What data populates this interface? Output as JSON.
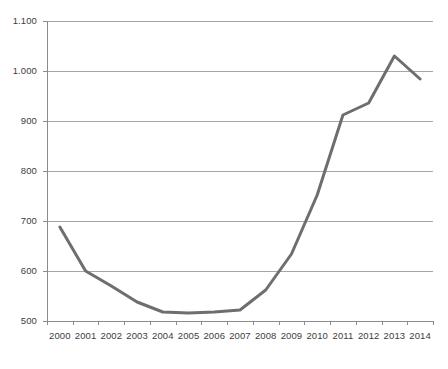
{
  "chart_data": {
    "type": "line",
    "title": "",
    "subtitle": "",
    "xlabel": "",
    "ylabel": "",
    "categories": [
      "2000",
      "2001",
      "2002",
      "2003",
      "2004",
      "2005",
      "2006",
      "2007",
      "2008",
      "2009",
      "2010",
      "2011",
      "2012",
      "2013",
      "2014"
    ],
    "series": [
      {
        "name": "",
        "values": [
          688,
          600,
          570,
          538,
          518,
          516,
          518,
          522,
          562,
          634,
          752,
          912,
          936,
          1030,
          984
        ]
      }
    ],
    "ylim": [
      500,
      1100
    ],
    "ytick_values": [
      500,
      600,
      700,
      800,
      900,
      1000,
      1100
    ],
    "ytick_labels": [
      "500",
      "600",
      "700",
      "800",
      "900",
      "1.000",
      "1.100"
    ],
    "xtick_labels": [
      "2000",
      "2001",
      "2002",
      "2003",
      "2004",
      "2005",
      "2006",
      "2007",
      "2008",
      "2009",
      "2010",
      "2011",
      "2012",
      "2013",
      "2014"
    ],
    "grid": true,
    "grid_axis": "y",
    "legend": false,
    "legend_position": "none",
    "colors": {
      "line": "#6e6e6e",
      "grid": "#a6a6a6",
      "axis": "#8c8c8c",
      "text": "#3d3d3d",
      "background": "#ffffff"
    },
    "line_width": 3
  }
}
